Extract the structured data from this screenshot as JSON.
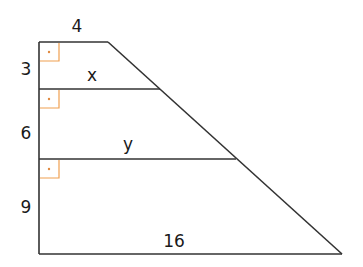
{
  "diagram": {
    "type": "trapezoid divided by parallel segments",
    "labels": {
      "top": "4",
      "left_top": "3",
      "left_middle": "6",
      "left_bottom": "9",
      "segment_1": "x",
      "segment_2": "y",
      "bottom": "16"
    },
    "right_angle_markers": 3,
    "colors": {
      "line": "#333333",
      "right_angle_marker": "#f0a050",
      "text": "#1a1a1a"
    }
  }
}
